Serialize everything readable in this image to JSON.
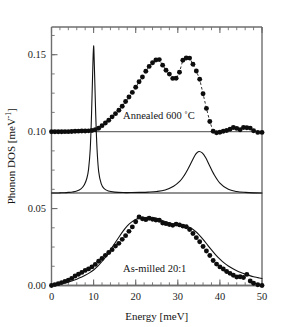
{
  "figure": {
    "background": "#ffffff",
    "ink_color": "#121212",
    "axis_color": "#6e6e6e"
  },
  "axes": {
    "x": {
      "title_text": "Energy [meV]",
      "title_main": "Energy [meV]",
      "min": 0,
      "max": 50,
      "major_ticks": [
        0,
        10,
        20,
        30,
        40,
        50
      ],
      "tick_labels": [
        "0",
        "10",
        "20",
        "30",
        "40",
        "50"
      ],
      "minor_tick_step": 2
    },
    "y": {
      "title_main": "Phonon DOS [meV",
      "title_sup": "-1",
      "title_tail": "]",
      "min": 0.0,
      "max": 0.168,
      "major_ticks": [
        0.0,
        0.05,
        0.1,
        0.15
      ],
      "tick_labels": [
        "0.00",
        "0.05",
        "0.10",
        "0.15"
      ],
      "minor_tick_step": 0.0125
    }
  },
  "annotations": [
    {
      "id": "annealed-label",
      "text": "Annealed 600 ˚C",
      "x": 17.0,
      "y": 0.1085
    },
    {
      "id": "as-milled-label",
      "text": "As-milled 20:1",
      "x": 17.0,
      "y": 0.0085
    }
  ],
  "chart_data": {
    "type": "scatter",
    "title": "",
    "subtitle": "",
    "xlabel": "Energy [meV]",
    "ylabel": "Phonon DOS [meV^-1]",
    "xlim": [
      0,
      50
    ],
    "ylim": [
      0.0,
      0.168
    ],
    "grid": false,
    "legend": "none",
    "series": [
      {
        "name": "Annealed 600 ˚C (measured)",
        "style": "filled-circles-with-dashed-connector",
        "offset": 0.1,
        "x": [
          0.0,
          0.8,
          1.6,
          2.4,
          3.2,
          4.0,
          4.8,
          5.6,
          6.4,
          7.2,
          8.0,
          8.8,
          9.6,
          10.4,
          11.2,
          12.0,
          12.8,
          13.6,
          14.4,
          15.2,
          16.0,
          16.8,
          17.6,
          18.4,
          19.2,
          20.0,
          20.8,
          21.6,
          22.4,
          23.2,
          24.0,
          24.8,
          25.6,
          26.4,
          27.2,
          28.0,
          28.8,
          29.6,
          30.4,
          31.2,
          32.0,
          32.8,
          33.6,
          34.4,
          35.2,
          36.0,
          36.8,
          37.6,
          38.4,
          39.2,
          40.0,
          40.8,
          41.6,
          42.4,
          43.2,
          44.0,
          44.8,
          45.6,
          46.4,
          47.2,
          48.0,
          49.0,
          50.0
        ],
        "y": [
          0.0999,
          0.0999,
          0.0999,
          0.0999,
          0.1,
          0.1,
          0.1001,
          0.1002,
          0.1003,
          0.1004,
          0.1004,
          0.1005,
          0.1007,
          0.1012,
          0.1022,
          0.1039,
          0.1056,
          0.1074,
          0.1096,
          0.1117,
          0.1139,
          0.1165,
          0.1196,
          0.1225,
          0.1255,
          0.1288,
          0.1324,
          0.1355,
          0.1392,
          0.1424,
          0.1448,
          0.1466,
          0.1468,
          0.1432,
          0.1399,
          0.1374,
          0.1346,
          0.1347,
          0.1386,
          0.1464,
          0.1479,
          0.1478,
          0.1438,
          0.1394,
          0.134,
          0.1246,
          0.1151,
          0.1066,
          0.1002,
          0.0993,
          0.0996,
          0.1002,
          0.1007,
          0.1015,
          0.1027,
          0.1021,
          0.1012,
          0.1027,
          0.1025,
          0.1023,
          0.1006,
          0.0995,
          0.0995
        ]
      },
      {
        "name": "Calculated crystalline DOS (offset curve)",
        "style": "smooth-line",
        "offset": 0.06,
        "x": [
          0.0,
          1.0,
          2.0,
          3.0,
          4.0,
          5.0,
          6.0,
          7.0,
          7.8,
          8.4,
          8.8,
          9.2,
          9.5,
          9.8,
          10.0,
          10.2,
          10.5,
          10.8,
          11.2,
          11.8,
          12.5,
          13.5,
          15.0,
          17.0,
          19.0,
          21.0,
          23.0,
          25.0,
          27.0,
          29.0,
          30.5,
          31.5,
          32.5,
          33.5,
          34.3,
          35.0,
          35.8,
          36.6,
          37.5,
          38.5,
          40.0,
          42.0,
          44.0,
          46.0,
          48.0,
          50.0
        ],
        "y": [
          0.0601,
          0.0601,
          0.0602,
          0.0603,
          0.0605,
          0.0608,
          0.0614,
          0.0628,
          0.0655,
          0.0697,
          0.0755,
          0.0885,
          0.1105,
          0.1405,
          0.1558,
          0.141,
          0.1115,
          0.0895,
          0.0742,
          0.0662,
          0.0629,
          0.0614,
          0.0607,
          0.0604,
          0.0604,
          0.0605,
          0.0607,
          0.0611,
          0.0621,
          0.0645,
          0.0678,
          0.0714,
          0.0762,
          0.0816,
          0.0855,
          0.0871,
          0.0862,
          0.0832,
          0.0782,
          0.0727,
          0.0666,
          0.0625,
          0.0611,
          0.0605,
          0.0602,
          0.0601
        ]
      },
      {
        "name": "As-milled 20:1 (measured)",
        "style": "filled-circles",
        "offset": 0.0,
        "x": [
          0.0,
          0.8,
          1.6,
          2.4,
          3.2,
          4.0,
          4.8,
          5.6,
          6.4,
          7.2,
          8.0,
          8.8,
          9.6,
          10.4,
          11.2,
          12.0,
          12.8,
          13.6,
          14.4,
          15.2,
          16.0,
          16.8,
          17.6,
          18.4,
          19.2,
          20.0,
          20.8,
          21.6,
          22.4,
          23.2,
          24.0,
          24.8,
          25.6,
          26.4,
          27.2,
          28.0,
          28.8,
          29.6,
          30.4,
          31.2,
          32.0,
          32.8,
          33.6,
          34.4,
          35.2,
          36.0,
          36.8,
          37.6,
          38.4,
          39.2,
          40.0,
          40.8,
          41.6,
          42.4,
          43.2,
          44.0,
          44.8,
          45.6,
          46.4,
          47.2,
          48.0,
          49.0,
          50.0
        ],
        "y": [
          0.0,
          0.0006,
          0.0012,
          0.0019,
          0.0027,
          0.0035,
          0.0046,
          0.0062,
          0.0073,
          0.0085,
          0.0098,
          0.0108,
          0.0121,
          0.0137,
          0.0158,
          0.0175,
          0.0196,
          0.0214,
          0.0233,
          0.0256,
          0.0274,
          0.03,
          0.0324,
          0.0352,
          0.0381,
          0.0414,
          0.0445,
          0.0434,
          0.0428,
          0.0437,
          0.0431,
          0.0426,
          0.0424,
          0.0406,
          0.0402,
          0.0396,
          0.0391,
          0.0399,
          0.0394,
          0.0386,
          0.0382,
          0.0364,
          0.0338,
          0.0311,
          0.0284,
          0.0253,
          0.0224,
          0.0195,
          0.0162,
          0.0139,
          0.0121,
          0.0107,
          0.0091,
          0.0079,
          0.0067,
          0.0055,
          0.0057,
          0.0052,
          0.0072,
          0.0029,
          0.0015,
          0.0005,
          0.0
        ]
      },
      {
        "name": "As-milled calculated curve",
        "style": "smooth-line",
        "offset": 0.0,
        "x": [
          0.0,
          1.0,
          2.0,
          3.0,
          4.0,
          5.0,
          6.0,
          7.0,
          8.0,
          9.0,
          10.0,
          11.0,
          12.0,
          13.0,
          14.0,
          15.0,
          16.0,
          17.0,
          18.0,
          19.0,
          20.0,
          21.0,
          22.0,
          23.0,
          24.0,
          25.0,
          26.0,
          27.0,
          28.0,
          29.0,
          30.0,
          31.0,
          32.0,
          33.0,
          34.0,
          35.0,
          36.0,
          37.0,
          38.0,
          39.0,
          40.0,
          41.0,
          42.0,
          43.0,
          44.0,
          45.0,
          46.0,
          47.0,
          48.0,
          49.0,
          50.0
        ],
        "y": [
          0.0,
          0.0004,
          0.0009,
          0.0015,
          0.0022,
          0.0031,
          0.0041,
          0.0053,
          0.0066,
          0.0082,
          0.0101,
          0.0126,
          0.0156,
          0.0191,
          0.0231,
          0.0273,
          0.0314,
          0.0353,
          0.0387,
          0.0412,
          0.0429,
          0.0438,
          0.0441,
          0.0443,
          0.0442,
          0.0436,
          0.0426,
          0.0415,
          0.0406,
          0.04,
          0.0397,
          0.0394,
          0.0387,
          0.0375,
          0.0356,
          0.0331,
          0.03,
          0.0266,
          0.0231,
          0.0199,
          0.0171,
          0.0147,
          0.0127,
          0.011,
          0.0096,
          0.0084,
          0.0074,
          0.0065,
          0.0057,
          0.0051,
          0.0045
        ]
      }
    ],
    "baselines": [
      {
        "name": "annealed-baseline",
        "value": 0.1
      },
      {
        "name": "calculated-baseline",
        "value": 0.0601
      },
      {
        "name": "as-milled-baseline",
        "value": 0.0
      }
    ]
  }
}
